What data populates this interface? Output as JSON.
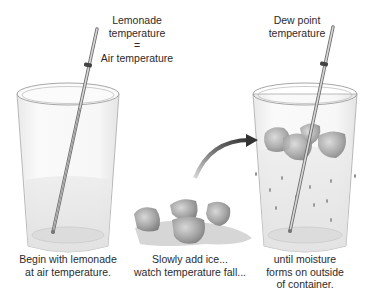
{
  "diagram": {
    "labels": {
      "top_left": [
        "Lemonade",
        "temperature",
        "=",
        "Air temperature"
      ],
      "top_right": [
        "Dew point",
        "temperature"
      ],
      "caption_left": [
        "Begin with lemonade",
        "at air temperature."
      ],
      "caption_center": [
        "Slowly add ice...",
        "watch temperature fall..."
      ],
      "caption_right": [
        "until moisture",
        "forms on outside",
        "of container."
      ]
    },
    "elements": {
      "glass_left": "glass of lemonade with thermometer",
      "glass_right": "glass of lemonade with ice, thermometer and condensation droplets",
      "ice_pile": "ice cubes in melt puddle",
      "arrow": "curved arrow from ice to right glass"
    },
    "colors": {
      "background": "#ffffff",
      "glass_outline": "#9a9a9a",
      "liquid": "#e6e6e6",
      "ice": "#a9a9a9",
      "arrow": "#3a3a3a",
      "text": "#2b2b2b"
    }
  }
}
